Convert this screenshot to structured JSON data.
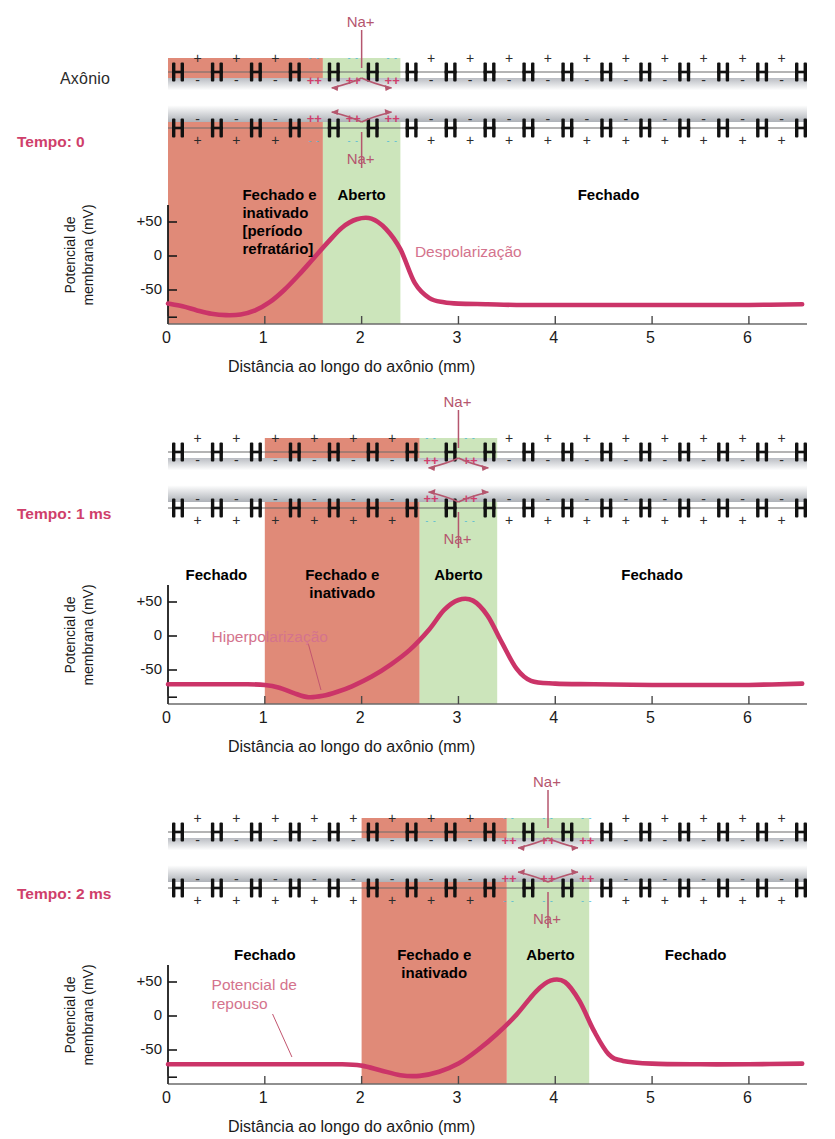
{
  "figure": {
    "axon_label": "Axônio",
    "na_ion": "Na+",
    "accent_magenta": "#cf3f6b",
    "curve_color": "#cb3468",
    "band_red": "#e08a78",
    "band_green": "#cce5bb",
    "annot_color": "#d4738d"
  },
  "axis": {
    "xlabel": "Distância ao longo do axônio (mm)",
    "ylabel_line1": "Potencial de",
    "ylabel_line2": "membrana (mV)",
    "xticks": [
      "0",
      "1",
      "2",
      "3",
      "4",
      "5",
      "6"
    ],
    "xtick_values": [
      0,
      1,
      2,
      3,
      4,
      5,
      6
    ],
    "yticks": [
      "+50",
      "0",
      "-50"
    ],
    "ytick_values": [
      50,
      0,
      -50
    ],
    "xlim": [
      0,
      6.6
    ],
    "ylim": [
      -100,
      75
    ]
  },
  "panels": [
    {
      "time_label": "Tempo: 0",
      "show_axon_label": true,
      "bands": [
        {
          "name": "refractory",
          "start": 0.0,
          "end": 1.6,
          "color": "#e08a78"
        },
        {
          "name": "open",
          "start": 1.6,
          "end": 2.4,
          "color": "#cce5bb"
        }
      ],
      "state_labels": [
        {
          "name": "fechado-e-inativado",
          "text": "Fechado e\ninativado\n[período\nrefratário]",
          "x": 0.8,
          "align": "left",
          "y": 186
        },
        {
          "name": "aberto",
          "text": "Aberto",
          "x": 2.0,
          "align": "center",
          "y": 186
        },
        {
          "name": "fechado-direita",
          "text": "Fechado",
          "x": 4.55,
          "align": "center",
          "y": 186
        }
      ],
      "annotations": [
        {
          "name": "despolarizacao",
          "text": "Despolarização",
          "x": 2.55,
          "y": 243,
          "leader": null
        }
      ],
      "open_zone": {
        "start": 1.6,
        "end": 2.4
      },
      "chart_data": {
        "type": "line",
        "title": "Tempo: 0",
        "x": [
          0.0,
          0.15,
          0.3,
          0.45,
          0.6,
          0.75,
          0.9,
          1.05,
          1.2,
          1.35,
          1.5,
          1.65,
          1.8,
          1.95,
          2.1,
          2.25,
          2.4,
          2.55,
          2.7,
          2.85,
          3.0,
          3.3,
          3.6,
          4.0,
          4.5,
          5.0,
          5.5,
          6.0,
          6.55
        ],
        "y": [
          -70,
          -74,
          -80,
          -85,
          -87,
          -86,
          -80,
          -68,
          -50,
          -28,
          -4,
          20,
          42,
          54,
          55,
          40,
          10,
          -40,
          -62,
          -68,
          -70,
          -71,
          -72,
          -72,
          -72,
          -72,
          -72,
          -72,
          -71
        ]
      }
    },
    {
      "time_label": "Tempo: 1 ms",
      "show_axon_label": false,
      "bands": [
        {
          "name": "refractory",
          "start": 1.0,
          "end": 2.6,
          "color": "#e08a78"
        },
        {
          "name": "open",
          "start": 2.6,
          "end": 3.4,
          "color": "#cce5bb"
        }
      ],
      "state_labels": [
        {
          "name": "fechado-esquerda",
          "text": "Fechado",
          "x": 0.5,
          "align": "center",
          "y": 186
        },
        {
          "name": "fechado-e-inativado",
          "text": "Fechado e\ninativado",
          "x": 1.8,
          "align": "center",
          "y": 186
        },
        {
          "name": "aberto",
          "text": "Aberto",
          "x": 3.0,
          "align": "center",
          "y": 186
        },
        {
          "name": "fechado-direita",
          "text": "Fechado",
          "x": 5.0,
          "align": "center",
          "y": 186
        }
      ],
      "annotations": [
        {
          "name": "hiperpolarizacao",
          "text": "Hiperpolarização",
          "x": 0.45,
          "y": 248,
          "leader": {
            "x1": 1.45,
            "y1": 264,
            "x2": 1.58,
            "y2": 310
          }
        }
      ],
      "open_zone": {
        "start": 2.6,
        "end": 3.4
      },
      "chart_data": {
        "type": "line",
        "title": "Tempo: 1 ms",
        "x": [
          0.0,
          0.4,
          0.8,
          1.0,
          1.15,
          1.3,
          1.45,
          1.6,
          1.75,
          1.9,
          2.1,
          2.3,
          2.5,
          2.7,
          2.85,
          3.0,
          3.15,
          3.3,
          3.45,
          3.6,
          3.75,
          4.0,
          4.4,
          5.0,
          5.6,
          6.0,
          6.55
        ],
        "y": [
          -71,
          -71,
          -71,
          -72,
          -76,
          -84,
          -90,
          -88,
          -82,
          -74,
          -60,
          -42,
          -20,
          10,
          38,
          53,
          52,
          30,
          -10,
          -48,
          -66,
          -70,
          -71,
          -72,
          -72,
          -72,
          -70
        ]
      }
    },
    {
      "time_label": "Tempo: 2 ms",
      "show_axon_label": false,
      "bands": [
        {
          "name": "refractory",
          "start": 2.0,
          "end": 3.5,
          "color": "#e08a78"
        },
        {
          "name": "open",
          "start": 3.5,
          "end": 4.35,
          "color": "#cce5bb"
        }
      ],
      "state_labels": [
        {
          "name": "fechado-esquerda",
          "text": "Fechado",
          "x": 1.0,
          "align": "center",
          "y": 186
        },
        {
          "name": "fechado-e-inativado",
          "text": "Fechado e\ninativado",
          "x": 2.75,
          "align": "center",
          "y": 186
        },
        {
          "name": "aberto",
          "text": "Aberto",
          "x": 3.95,
          "align": "center",
          "y": 186
        },
        {
          "name": "fechado-direita",
          "text": "Fechado",
          "x": 5.45,
          "align": "center",
          "y": 186
        }
      ],
      "annotations": [
        {
          "name": "potencial-de-repouso",
          "text": "Potencial de\nrepouso",
          "x": 0.45,
          "y": 216,
          "leader": {
            "x1": 1.08,
            "y1": 254,
            "x2": 1.28,
            "y2": 297
          }
        }
      ],
      "open_zone": {
        "start": 3.5,
        "end": 4.35
      },
      "chart_data": {
        "type": "line",
        "title": "Tempo: 2 ms",
        "x": [
          0.0,
          0.6,
          1.2,
          1.8,
          2.0,
          2.2,
          2.4,
          2.6,
          2.8,
          3.0,
          3.2,
          3.4,
          3.6,
          3.8,
          3.95,
          4.1,
          4.25,
          4.4,
          4.55,
          4.7,
          5.0,
          5.5,
          6.0,
          6.55
        ],
        "y": [
          -71,
          -71,
          -71,
          -71,
          -73,
          -80,
          -87,
          -88,
          -82,
          -70,
          -50,
          -26,
          2,
          36,
          52,
          50,
          22,
          -22,
          -56,
          -66,
          -70,
          -71,
          -71,
          -70
        ]
      }
    }
  ],
  "membrane": {
    "charge_plus": "+",
    "charge_minus": "-",
    "active_plus": "++",
    "active_minus": "- -"
  }
}
